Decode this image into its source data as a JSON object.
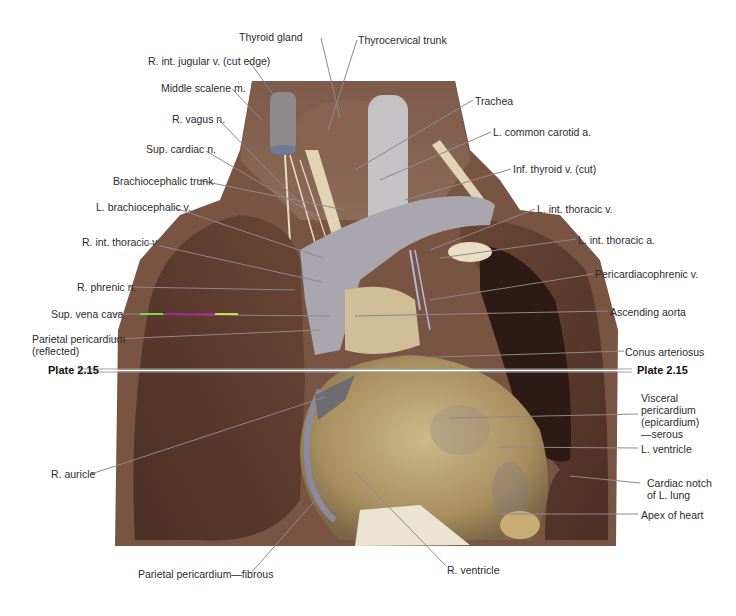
{
  "figure": {
    "type": "anatomical-photo",
    "plate_reference": "Plate 2.15"
  },
  "labels_left": [
    {
      "id": "r-int-jugular-v",
      "text": "R. int. jugular v. (cut edge)"
    },
    {
      "id": "middle-scalene-m",
      "text": "Middle scalene m."
    },
    {
      "id": "r-vagus-n",
      "text": "R. vagus n."
    },
    {
      "id": "sup-cardiac-n",
      "text": "Sup. cardiac n."
    },
    {
      "id": "brachiocephalic-trunk",
      "text": "Brachiocephalic trunk"
    },
    {
      "id": "l-brachiocephalic-v",
      "text": "L. brachiocephalic v."
    },
    {
      "id": "r-int-thoracic-v",
      "text": "R. int. thoracic v."
    },
    {
      "id": "r-phrenic-n",
      "text": "R. phrenic n."
    },
    {
      "id": "sup-vena-cava",
      "text": "Sup. vena cava"
    },
    {
      "id": "parietal-pericardium-reflected",
      "text": "Parietal pericardium\n(reflected)"
    },
    {
      "id": "r-auricle",
      "text": "R. auricle"
    }
  ],
  "labels_top": [
    {
      "id": "thyroid-gland",
      "text": "Thyroid gland"
    },
    {
      "id": "thyrocervical-trunk",
      "text": "Thyrocervical trunk"
    }
  ],
  "labels_right": [
    {
      "id": "trachea",
      "text": "Trachea"
    },
    {
      "id": "l-common-carotid-a",
      "text": "L. common carotid a."
    },
    {
      "id": "inf-thyroid-v",
      "text": "Inf. thyroid v. (cut)"
    },
    {
      "id": "l-int-thoracic-v",
      "text": "L. int. thoracic v."
    },
    {
      "id": "l-int-thoracic-a",
      "text": "L. int. thoracic a."
    },
    {
      "id": "pericardiacophrenic-v",
      "text": "Pericardiacophrenic v."
    },
    {
      "id": "ascending-aorta",
      "text": "Ascending aorta"
    },
    {
      "id": "conus-arteriosus",
      "text": "Conus arteriosus"
    },
    {
      "id": "visceral-pericardium",
      "text": "Visceral\npericardium\n(epicardium)\n—serous"
    },
    {
      "id": "l-ventricle",
      "text": "L. ventricle"
    },
    {
      "id": "cardiac-notch",
      "text": "Cardiac notch\nof L. lung"
    },
    {
      "id": "apex-of-heart",
      "text": "Apex of heart"
    }
  ],
  "labels_bottom": [
    {
      "id": "parietal-pericardium-fibrous",
      "text": "Parietal pericardium—fibrous"
    },
    {
      "id": "r-ventricle",
      "text": "R. ventricle"
    }
  ],
  "plate_markers": {
    "left": "Plate 2.15",
    "right": "Plate 2.15"
  },
  "colors": {
    "background": "#ffffff",
    "leader_line": "#8a8a8a",
    "lung_tissue": "#5b3a2e",
    "heart_surface": "#b8a377",
    "vessels_grey": "#a7a6ad",
    "label_text": "#2b2b2b"
  }
}
